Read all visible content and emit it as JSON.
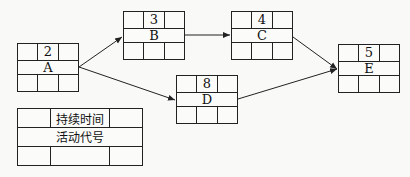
{
  "nodes": [
    {
      "id": "A",
      "duration": "2",
      "x": 17,
      "y": 43,
      "w": 62,
      "h": 49
    },
    {
      "id": "B",
      "duration": "3",
      "x": 123,
      "y": 11,
      "w": 62,
      "h": 49
    },
    {
      "id": "C",
      "duration": "4",
      "x": 231,
      "y": 11,
      "w": 62,
      "h": 49
    },
    {
      "id": "D",
      "duration": "8",
      "x": 176,
      "y": 75,
      "w": 62,
      "h": 49
    },
    {
      "id": "E",
      "duration": "5",
      "x": 338,
      "y": 44,
      "w": 62,
      "h": 49
    }
  ],
  "edges": [
    {
      "from": "A",
      "to": "B"
    },
    {
      "from": "A",
      "to": "D"
    },
    {
      "from": "B",
      "to": "C"
    },
    {
      "from": "C",
      "to": "E"
    },
    {
      "from": "D",
      "to": "E"
    }
  ],
  "legend": {
    "duration_label": "持续时间",
    "activity_label": "活动代号"
  },
  "colors": {
    "line": "#222222",
    "background": "#f9f9f8"
  }
}
